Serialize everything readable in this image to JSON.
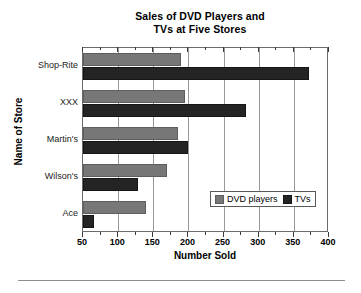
{
  "chart_data": {
    "type": "bar",
    "orientation": "horizontal",
    "title": "Sales of DVD Players and TVs at Five Stores",
    "title_lines": [
      "Sales of DVD Players and",
      "TVs at Five Stores"
    ],
    "xlabel": "Number Sold",
    "ylabel": "Name of Store",
    "categories": [
      "Shop-Rite",
      "XXX",
      "Martin's",
      "Wilson's",
      "Ace"
    ],
    "series": [
      {
        "name": "DVD players",
        "color": "#777777",
        "values": [
          190,
          195,
          185,
          170,
          140
        ]
      },
      {
        "name": "TVs",
        "color": "#242424",
        "values": [
          372,
          282,
          200,
          128,
          65
        ]
      }
    ],
    "xlim": [
      50,
      400
    ],
    "xticks": [
      50,
      100,
      150,
      200,
      250,
      300,
      350,
      400
    ],
    "xtick_labels": [
      "50",
      "100",
      "150",
      "200",
      "250",
      "300",
      "350",
      "400"
    ],
    "minor_tick_step": 25,
    "grid": "vertical",
    "legend_position": "lower right",
    "legend_entries": [
      "DVD players",
      "TVs"
    ]
  }
}
